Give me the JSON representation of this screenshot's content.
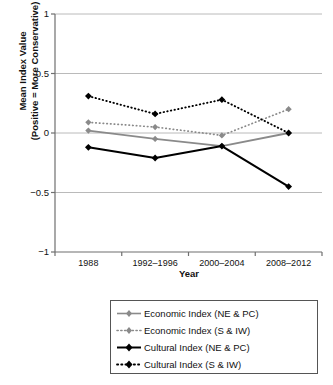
{
  "chart_data": {
    "type": "line",
    "title": "",
    "xlabel": "Year",
    "ylabel": "Mean Index Value\n(Positive = More Conservative)",
    "categories": [
      "1988",
      "1992–1996",
      "2000–2004",
      "2008–2012"
    ],
    "ylim": [
      -1,
      1
    ],
    "yticks": [
      "1",
      "0.5",
      "0",
      "−0.5",
      "−1"
    ],
    "ytick_values": [
      1,
      0.5,
      0,
      -0.5,
      -1
    ],
    "grid": "horizontal",
    "legend_position": "bottom",
    "series": [
      {
        "name": "Economic Index (NE & PC)",
        "values": [
          0.02,
          -0.05,
          -0.11,
          0.0
        ],
        "color": "#8a8a8a",
        "style": "solid",
        "marker": "diamond"
      },
      {
        "name": "Economic Index (S & IW)",
        "values": [
          0.09,
          0.05,
          -0.02,
          0.2
        ],
        "color": "#8a8a8a",
        "style": "dotted",
        "marker": "diamond"
      },
      {
        "name": "Cultural Index (NE & PC)",
        "values": [
          -0.12,
          -0.21,
          -0.11,
          -0.45
        ],
        "color": "#000000",
        "style": "solid",
        "marker": "diamond"
      },
      {
        "name": "Cultural Index (S & IW)",
        "values": [
          0.31,
          0.16,
          0.28,
          0.0
        ],
        "color": "#000000",
        "style": "dotted",
        "marker": "diamond"
      }
    ]
  },
  "axis": {
    "y_title": "Mean Index Value\n(Positive = More Conservative)",
    "x_title": "Year"
  },
  "legend": {
    "items": [
      {
        "label": "Economic Index (NE & PC)"
      },
      {
        "label": "Economic Index (S & IW)"
      },
      {
        "label": "Cultural Index (NE & PC)"
      },
      {
        "label": "Cultural Index (S & IW)"
      }
    ]
  }
}
